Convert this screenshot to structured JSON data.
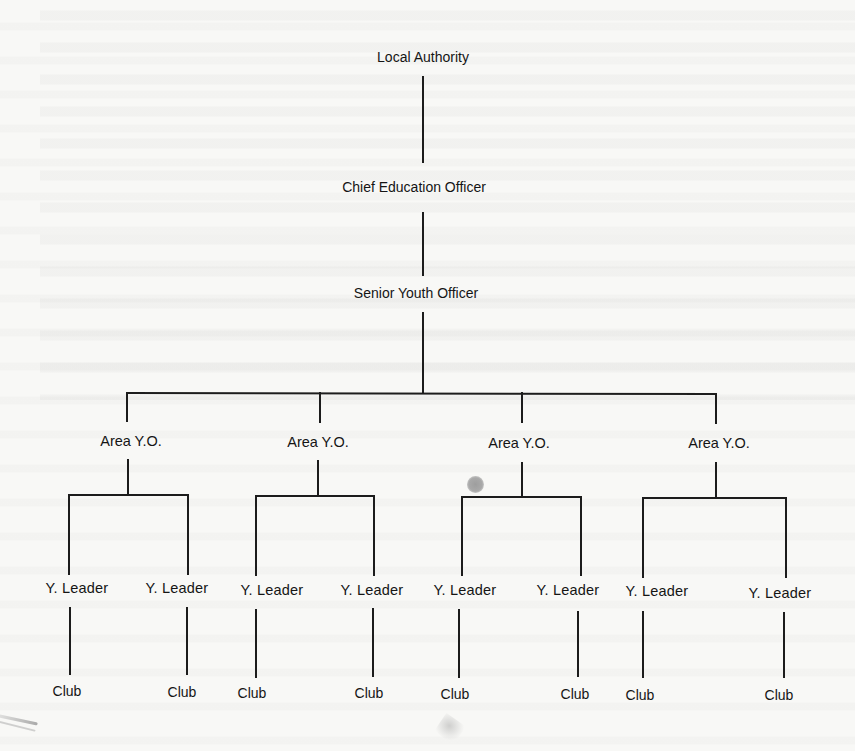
{
  "diagram": {
    "type": "organization-chart",
    "stroke_color": "#1a1a1a",
    "background_color": "#f8f8f6",
    "nodes": {
      "local_authority": "Local Authority",
      "chief_education_officer": "Chief Education Officer",
      "senior_youth_officer": "Senior Youth Officer",
      "areas": [
        {
          "label": "Area Y.O.",
          "leaders": [
            {
              "label": "Y. Leader",
              "club": "Club"
            },
            {
              "label": "Y. Leader",
              "club": "Club"
            }
          ]
        },
        {
          "label": "Area Y.O.",
          "leaders": [
            {
              "label": "Y. Leader",
              "club": "Club"
            },
            {
              "label": "Y. Leader",
              "club": "Club"
            }
          ]
        },
        {
          "label": "Area Y.O.",
          "leaders": [
            {
              "label": "Y. Leader",
              "club": "Club"
            },
            {
              "label": "Y. Leader",
              "club": "Club"
            }
          ]
        },
        {
          "label": "Area Y.O.",
          "leaders": [
            {
              "label": "Y. Leader",
              "club": "Club"
            },
            {
              "label": "Y. Leader",
              "club": "Club"
            }
          ]
        }
      ]
    },
    "hierarchy": [
      "Local Authority",
      "Chief Education Officer",
      "Senior Youth Officer",
      "Area Y.O. (x4)",
      "Y. Leader (x8)",
      "Club (x8)"
    ]
  }
}
